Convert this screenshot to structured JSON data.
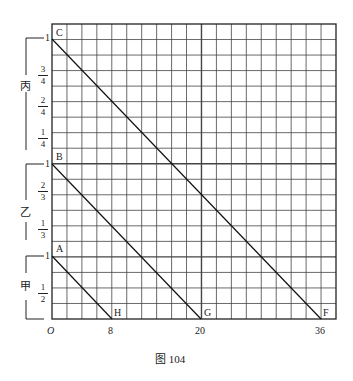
{
  "figure": {
    "caption": "图 104",
    "origin_label": "O",
    "x_ticks": [
      {
        "value": 8,
        "label": "8"
      },
      {
        "value": 20,
        "label": "20"
      },
      {
        "value": 36,
        "label": "36"
      }
    ],
    "groups": [
      {
        "name": "丙",
        "top_label": "1",
        "fractions": [
          {
            "num": "3",
            "den": "4"
          },
          {
            "num": "2",
            "den": "4"
          },
          {
            "num": "1",
            "den": "4"
          }
        ]
      },
      {
        "name": "乙",
        "top_label": "1",
        "fractions": [
          {
            "num": "2",
            "den": "3"
          },
          {
            "num": "1",
            "den": "3"
          }
        ]
      },
      {
        "name": "甲",
        "top_label": "1",
        "fractions": [
          {
            "num": "1",
            "den": "2"
          }
        ]
      }
    ],
    "points": {
      "A": "A",
      "B": "B",
      "C": "C",
      "F": "F",
      "G": "G",
      "H": "H"
    },
    "lines": [
      {
        "from": "A",
        "to": "H",
        "x_end": 8
      },
      {
        "from": "B",
        "to": "G",
        "x_end": 20
      },
      {
        "from": "C",
        "to": "F",
        "x_end": 36
      }
    ],
    "grid": {
      "columns": 19,
      "rows": 19
    }
  }
}
